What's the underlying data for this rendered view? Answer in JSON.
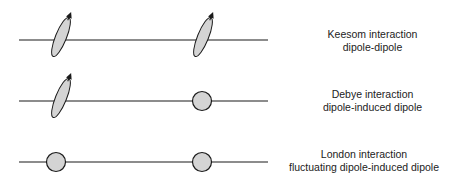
{
  "colors": {
    "line": "#1a1a1a",
    "fill": "#d4d4d4",
    "text": "#222222"
  },
  "rows": [
    {
      "id": "keesom",
      "title": "Keesom interaction",
      "subtitle": "dipole-dipole",
      "left_particle": "dipole",
      "right_particle": "dipole"
    },
    {
      "id": "debye",
      "title": "Debye interaction",
      "subtitle": "dipole-induced dipole",
      "left_particle": "dipole",
      "right_particle": "induced-dipole"
    },
    {
      "id": "london",
      "title": "London interaction",
      "subtitle": "fluctuating dipole-induced dipole",
      "left_particle": "induced-dipole",
      "right_particle": "induced-dipole"
    }
  ]
}
